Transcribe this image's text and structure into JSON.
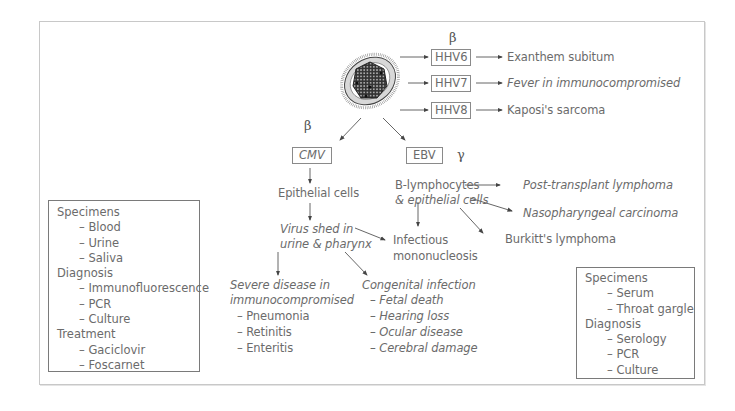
{
  "diagram": {
    "virus_icon": "herpesvirus-icon",
    "beta_top": "β",
    "beta_cmv": "β",
    "gamma_ebv": "γ",
    "hhv_rows": [
      {
        "label": "HHV6",
        "outcome": "Exanthem subitum"
      },
      {
        "label": "HHV7",
        "outcome": "Fever in immunocompromised"
      },
      {
        "label": "HHV8",
        "outcome": "Kaposi's sarcoma"
      }
    ],
    "cmv": {
      "label": "CMV",
      "step1": "Epithelial cells",
      "step2_line1": "Virus shed in",
      "step2_line2": "urine & pharynx",
      "severe": {
        "line1": "Severe disease in",
        "line2": "immunocompromised",
        "items": [
          "– Pneumonia",
          "– Retinitis",
          "– Enteritis"
        ]
      },
      "congenital": {
        "title": "Congenital infection",
        "items": [
          "– Fetal death",
          "– Hearing loss",
          "– Ocular disease",
          "– Cerebral damage"
        ]
      }
    },
    "shared": {
      "line1": "Infectious",
      "line2": "mononucleosis"
    },
    "ebv": {
      "label": "EBV",
      "cells_line1": "B-lymphocytes",
      "cells_line2": "& epithelial cells",
      "outcomes": [
        "Post-transplant lymphoma",
        "Nasopharyngeal carcinoma",
        "Burkitt's lymphoma"
      ]
    },
    "cmv_box": {
      "rows": [
        {
          "text": "Specimens",
          "sub": false
        },
        {
          "text": "– Blood",
          "sub": true
        },
        {
          "text": "– Urine",
          "sub": true
        },
        {
          "text": "– Saliva",
          "sub": true
        },
        {
          "text": "Diagnosis",
          "sub": false
        },
        {
          "text": "– Immunofluorescence",
          "sub": true
        },
        {
          "text": "– PCR",
          "sub": true
        },
        {
          "text": "– Culture",
          "sub": true
        },
        {
          "text": "Treatment",
          "sub": false
        },
        {
          "text": "– Gaciclovir",
          "sub": true
        },
        {
          "text": "– Foscarnet",
          "sub": true
        }
      ]
    },
    "ebv_box": {
      "rows": [
        {
          "text": "Specimens",
          "sub": false
        },
        {
          "text": "– Serum",
          "sub": true
        },
        {
          "text": "– Throat gargle",
          "sub": true
        },
        {
          "text": "Diagnosis",
          "sub": false
        },
        {
          "text": "– Serology",
          "sub": true
        },
        {
          "text": "– PCR",
          "sub": true
        },
        {
          "text": "– Culture",
          "sub": true
        }
      ]
    }
  }
}
